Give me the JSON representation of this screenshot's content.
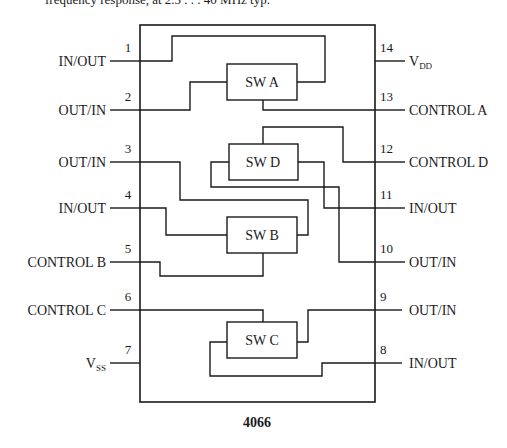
{
  "caption_fragment": "frequency response, at 2.5 . . . 40 MHz typ.",
  "chip": {
    "part_number": "4066",
    "left_pins": [
      {
        "number": "1",
        "label": "IN/OUT"
      },
      {
        "number": "2",
        "label": "OUT/IN"
      },
      {
        "number": "3",
        "label": "OUT/IN"
      },
      {
        "number": "4",
        "label": "IN/OUT"
      },
      {
        "number": "5",
        "label": "CONTROL B"
      },
      {
        "number": "6",
        "label": "CONTROL C"
      },
      {
        "number": "7",
        "label": "V",
        "subscript": "SS"
      }
    ],
    "right_pins": [
      {
        "number": "14",
        "label": "V",
        "subscript": "DD"
      },
      {
        "number": "13",
        "label": "CONTROL A"
      },
      {
        "number": "12",
        "label": "CONTROL D"
      },
      {
        "number": "11",
        "label": "IN/OUT"
      },
      {
        "number": "10",
        "label": "OUT/IN"
      },
      {
        "number": "9",
        "label": "OUT/IN"
      },
      {
        "number": "8",
        "label": "IN/OUT"
      }
    ],
    "switches": [
      {
        "id": "A",
        "label": "SW A"
      },
      {
        "id": "D",
        "label": "SW D"
      },
      {
        "id": "B",
        "label": "SW B"
      },
      {
        "id": "C",
        "label": "SW C"
      }
    ]
  }
}
